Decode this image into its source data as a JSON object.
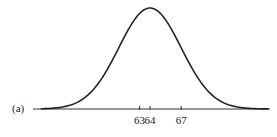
{
  "chart_data": {
    "type": "line",
    "title": "",
    "panel_label": "(a)",
    "xlabel": "",
    "ylabel": "",
    "distribution": "normal",
    "mean": 64,
    "sd": 3,
    "tick_labels": [
      "63",
      "64",
      "67"
    ],
    "ticks": [
      63,
      64,
      67
    ],
    "xlim": [
      53.5,
      75.5
    ],
    "grid": false,
    "legend": null,
    "colors": {
      "curve": "#222222",
      "axis": "#333333"
    }
  }
}
